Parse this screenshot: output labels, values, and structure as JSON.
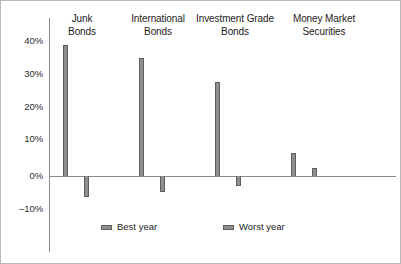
{
  "chart_data": {
    "type": "bar",
    "title": "",
    "subtitle": "",
    "xlabel": "",
    "ylabel": "",
    "categories": [
      "Junk\nBonds",
      "International\nBonds",
      "Investment Grade\nBonds",
      "Money Market\nSecurities"
    ],
    "series": [
      {
        "name": "Best year",
        "values": [
          40,
          36,
          28.7,
          7
        ]
      },
      {
        "name": "Worst year",
        "values": [
          -6.5,
          -5,
          -3,
          2.5
        ]
      }
    ],
    "ylim": [
      -14,
      44
    ],
    "ytick_labels": [
      "40%",
      "30%",
      "20%",
      "10%",
      "0%",
      "–10%"
    ],
    "ytick_values": [
      40,
      30,
      20,
      10,
      0,
      -10
    ],
    "grid": false,
    "legend_position": "bottom",
    "zero_line": true,
    "colors": {
      "bar_fill": "#8f8f8f",
      "bar_stroke": "#5e5e5e",
      "axis": "#8a8a8a",
      "text": "#1d1d1d",
      "frame": "#b9b9b9",
      "background": "#ffffff"
    }
  },
  "legend": {
    "entries": [
      {
        "label": "Best year"
      },
      {
        "label": "Worst year"
      }
    ]
  },
  "axis": {
    "ticks": [
      {
        "label": "40%"
      },
      {
        "label": "30%"
      },
      {
        "label": "20%"
      },
      {
        "label": "10%"
      },
      {
        "label": "0%"
      },
      {
        "label": "–10%"
      }
    ]
  },
  "categories": [
    {
      "label": "Junk\nBonds"
    },
    {
      "label": "International\nBonds"
    },
    {
      "label": "Investment Grade\nBonds"
    },
    {
      "label": "Money Market\nSecurities"
    }
  ]
}
